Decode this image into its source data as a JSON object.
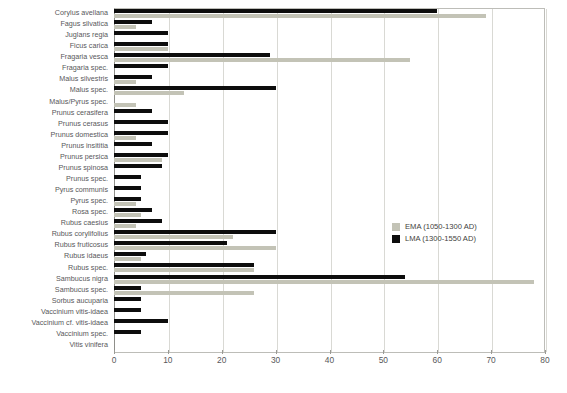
{
  "chart_data": {
    "type": "bar",
    "orientation": "horizontal",
    "title": "",
    "subtitle": "",
    "xlabel": "",
    "ylabel": "",
    "xlim": [
      0,
      80
    ],
    "xticks": [
      0,
      10,
      20,
      30,
      40,
      50,
      60,
      70,
      80
    ],
    "grid": true,
    "legend_position": "center-right",
    "categories": [
      "Corylus avellana",
      "Fagus silvatica",
      "Juglans regia",
      "Ficus carica",
      "Fragaria vesca",
      "Fragaria spec.",
      "Malus silvestris",
      "Malus spec.",
      "Malus/Pyrus spec.",
      "Prunus cerasifera",
      "Prunus cerasus",
      "Prunus domestica",
      "Prunus insititia",
      "Prunus persica",
      "Prunus spinosa",
      "Prunus spec.",
      "Pyrus communis",
      "Pyrus spec.",
      "Rosa spec.",
      "Rubus caesius",
      "Rubus corylifolius",
      "Rubus fruticosus",
      "Rubus idaeus",
      "Rubus spec.",
      "Sambucus nigra",
      "Sambucus spec.",
      "Sorbus aucuparia",
      "Vaccinium vitis-idaea",
      "Vaccinium cf. vitis-idaea",
      "Vaccinium spec.",
      "Vitis vinifera"
    ],
    "series": [
      {
        "name": "EMA (1050-1300 AD)",
        "color": "#c3c3b6",
        "values": [
          69,
          4,
          0,
          10,
          55,
          0,
          4,
          13,
          4,
          0,
          0,
          4,
          0,
          9,
          0,
          0,
          0,
          4,
          5,
          4,
          22,
          30,
          5,
          26,
          78,
          26,
          0,
          0,
          0,
          0,
          0
        ]
      },
      {
        "name": "LMA (1300-1550 AD)",
        "color": "#0d0d0d",
        "values": [
          60,
          7,
          10,
          10,
          29,
          10,
          7,
          30,
          0,
          7,
          10,
          10,
          7,
          10,
          9,
          5,
          5,
          5,
          7,
          9,
          30,
          21,
          6,
          26,
          54,
          5,
          5,
          5,
          10,
          5,
          0
        ]
      }
    ]
  },
  "legend": {
    "items": [
      {
        "label": "EMA (1050-1300 AD)",
        "color": "#c3c3b6"
      },
      {
        "label": "LMA (1300-1550 AD)",
        "color": "#0d0d0d"
      }
    ]
  }
}
